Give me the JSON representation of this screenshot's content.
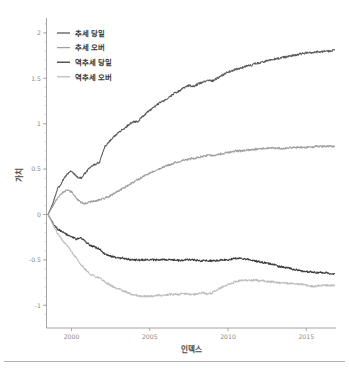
{
  "chart_data": {
    "type": "line",
    "title": "",
    "xlabel": "인덱스",
    "ylabel": "가치",
    "xlim": [
      1998.4,
      2016.9
    ],
    "ylim": [
      -1.25,
      2.12
    ],
    "grid": false,
    "legend_position": "upper-left",
    "xticks": [
      "2000",
      "2005",
      "2010",
      "2015"
    ],
    "xtick_values": [
      2000,
      2005,
      2010,
      2015
    ],
    "yticks": [
      "2",
      "1.5",
      "1",
      "0.5",
      "0",
      "-0.5",
      "-1"
    ],
    "ytick_values": [
      2,
      1.5,
      1,
      0.5,
      0,
      -0.5,
      -1
    ],
    "x": [
      1998.5,
      1998.8,
      1999.1,
      1999.4,
      1999.7,
      2000.0,
      2000.3,
      2000.6,
      2000.9,
      2001.2,
      2001.5,
      2001.8,
      2002.1,
      2002.4,
      2002.7,
      2003.0,
      2003.3,
      2003.6,
      2003.9,
      2004.2,
      2004.5,
      2004.8,
      2005.1,
      2005.4,
      2005.7,
      2006.0,
      2006.3,
      2006.6,
      2006.9,
      2007.2,
      2007.5,
      2007.8,
      2008.1,
      2008.4,
      2008.7,
      2009.0,
      2009.3,
      2009.6,
      2009.9,
      2010.2,
      2010.5,
      2010.8,
      2011.1,
      2011.4,
      2011.7,
      2012.0,
      2012.3,
      2012.6,
      2012.9,
      2013.2,
      2013.5,
      2013.8,
      2014.1,
      2014.4,
      2014.7,
      2015.0,
      2015.3,
      2015.6,
      2015.9,
      2016.2,
      2016.5,
      2016.8
    ],
    "series": [
      {
        "name": "추세 당일",
        "color": "#5a5a5a",
        "values": [
          0.0,
          0.12,
          0.28,
          0.36,
          0.44,
          0.48,
          0.42,
          0.4,
          0.46,
          0.52,
          0.55,
          0.58,
          0.74,
          0.8,
          0.86,
          0.9,
          0.94,
          0.98,
          1.02,
          1.02,
          1.07,
          1.12,
          1.16,
          1.2,
          1.24,
          1.26,
          1.3,
          1.34,
          1.36,
          1.4,
          1.42,
          1.41,
          1.44,
          1.46,
          1.48,
          1.47,
          1.5,
          1.53,
          1.56,
          1.58,
          1.6,
          1.61,
          1.63,
          1.64,
          1.66,
          1.67,
          1.68,
          1.7,
          1.71,
          1.72,
          1.73,
          1.74,
          1.75,
          1.76,
          1.77,
          1.78,
          1.78,
          1.79,
          1.79,
          1.8,
          1.8,
          1.81
        ]
      },
      {
        "name": "추세 오버",
        "color": "#9e9e9e",
        "values": [
          0.0,
          0.09,
          0.18,
          0.24,
          0.27,
          0.25,
          0.18,
          0.13,
          0.12,
          0.14,
          0.15,
          0.16,
          0.18,
          0.2,
          0.23,
          0.26,
          0.29,
          0.32,
          0.35,
          0.38,
          0.41,
          0.44,
          0.46,
          0.49,
          0.51,
          0.53,
          0.55,
          0.57,
          0.58,
          0.6,
          0.61,
          0.62,
          0.63,
          0.64,
          0.65,
          0.65,
          0.66,
          0.67,
          0.68,
          0.69,
          0.7,
          0.7,
          0.71,
          0.71,
          0.72,
          0.72,
          0.73,
          0.73,
          0.73,
          0.73,
          0.73,
          0.73,
          0.74,
          0.74,
          0.74,
          0.74,
          0.74,
          0.75,
          0.75,
          0.75,
          0.75,
          0.75
        ]
      },
      {
        "name": "역추세 당일",
        "color": "#3c3c3c",
        "values": [
          0.0,
          -0.09,
          -0.16,
          -0.19,
          -0.22,
          -0.25,
          -0.27,
          -0.26,
          -0.3,
          -0.34,
          -0.36,
          -0.38,
          -0.43,
          -0.45,
          -0.47,
          -0.48,
          -0.48,
          -0.49,
          -0.5,
          -0.5,
          -0.5,
          -0.5,
          -0.5,
          -0.5,
          -0.5,
          -0.5,
          -0.5,
          -0.5,
          -0.51,
          -0.5,
          -0.5,
          -0.5,
          -0.51,
          -0.51,
          -0.51,
          -0.51,
          -0.51,
          -0.5,
          -0.5,
          -0.49,
          -0.48,
          -0.48,
          -0.49,
          -0.5,
          -0.51,
          -0.52,
          -0.53,
          -0.54,
          -0.55,
          -0.57,
          -0.58,
          -0.59,
          -0.6,
          -0.61,
          -0.62,
          -0.63,
          -0.63,
          -0.64,
          -0.64,
          -0.64,
          -0.65,
          -0.65
        ]
      },
      {
        "name": "역추세 오버",
        "color": "#bdbdbd",
        "values": [
          0.0,
          -0.11,
          -0.21,
          -0.28,
          -0.34,
          -0.41,
          -0.48,
          -0.55,
          -0.61,
          -0.66,
          -0.68,
          -0.7,
          -0.74,
          -0.77,
          -0.8,
          -0.82,
          -0.84,
          -0.86,
          -0.88,
          -0.89,
          -0.9,
          -0.9,
          -0.9,
          -0.89,
          -0.89,
          -0.89,
          -0.88,
          -0.88,
          -0.88,
          -0.87,
          -0.88,
          -0.88,
          -0.87,
          -0.86,
          -0.88,
          -0.86,
          -0.83,
          -0.8,
          -0.78,
          -0.76,
          -0.74,
          -0.73,
          -0.72,
          -0.73,
          -0.72,
          -0.73,
          -0.73,
          -0.74,
          -0.74,
          -0.75,
          -0.75,
          -0.76,
          -0.76,
          -0.77,
          -0.77,
          -0.78,
          -0.79,
          -0.79,
          -0.78,
          -0.78,
          -0.78,
          -0.78
        ]
      }
    ]
  },
  "legend": {
    "items": [
      {
        "label": "추세 당일",
        "color": "#5a5a5a"
      },
      {
        "label": "추세 오버",
        "color": "#9e9e9e"
      },
      {
        "label": "역추세 당일",
        "color": "#3c3c3c"
      },
      {
        "label": "역추세 오버",
        "color": "#bdbdbd"
      }
    ]
  },
  "footer": {
    "rule_color": "#b0b0b0"
  }
}
